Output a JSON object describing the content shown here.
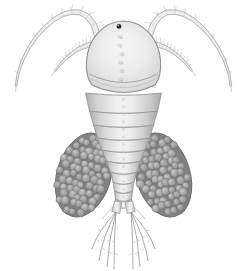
{
  "figure": {
    "background": "#ffffff",
    "colors": {
      "outline": "#8f8f8f",
      "segment_edge": "#999999",
      "body_light": "#f7f7f7",
      "body_shade": "#b9b9b9",
      "antenna_fill": "#eeeeee",
      "antenna_edge": "#a3a3a3",
      "hair": "#a9a9a9",
      "eye": "#2d2d2d",
      "eye_glint": "#f2f2f2",
      "egg_base": "#828282",
      "egg_edge": "#6a6a6a",
      "egg_hi": "#cbcbcb",
      "egg_mid": "#a5a5a5",
      "egg_lo": "#777777",
      "seta": "#909090",
      "texture": "#c3c3c3"
    },
    "center_x": 123.5,
    "eye": {
      "cx": 119,
      "cy": 26.4,
      "r": 2.4
    },
    "cephalothorax": {
      "path": "M 123.5 21 C 103 21.5 88 39 86.5 61 C 85.8 72 88 80 92 85 Q 123.5 100 155 85 C 159 80 161.2 72 160.5 61 C 159 39 144 21.5 123.5 21 Z",
      "rim_arcs": [
        "M 89.5 74 Q 123.5 91 157.5 74",
        "M 91.5 79 Q 123.5 96 155.5 79"
      ],
      "texture_ys": [
        37,
        45.5,
        54,
        62.5,
        71,
        79.5
      ]
    },
    "segments": [
      [
        93,
        111,
        38,
        34
      ],
      [
        111,
        125,
        34,
        30
      ],
      [
        125,
        138,
        30,
        26
      ],
      [
        138,
        150,
        26,
        21.5
      ],
      [
        150,
        161,
        21.5,
        17
      ],
      [
        161,
        172,
        17,
        13
      ],
      [
        172,
        182,
        13,
        10.5
      ],
      [
        182,
        191,
        10.5,
        9
      ],
      [
        191,
        199,
        9,
        8
      ],
      [
        199,
        206,
        8,
        8.6
      ]
    ],
    "antennae": [
      {
        "name": "antenna-left-outer",
        "p": [
          [
            98,
            37
          ],
          [
            85,
            -22
          ],
          [
            20,
            34
          ],
          [
            16,
            86
          ]
        ],
        "w": [
          6,
          1.6
        ],
        "side": 1
      },
      {
        "name": "antenna-left-inner",
        "p": [
          [
            94,
            44
          ],
          [
            80,
            46
          ],
          [
            68,
            54
          ],
          [
            55,
            71
          ]
        ],
        "w": [
          5,
          1.4
        ],
        "side": 1
      },
      {
        "name": "antenna-right-outer",
        "p": [
          [
            149,
            37
          ],
          [
            162,
            -22
          ],
          [
            227,
            34
          ],
          [
            231,
            86
          ]
        ],
        "w": [
          6,
          1.6
        ],
        "side": -1
      },
      {
        "name": "antenna-right-inner",
        "p": [
          [
            153,
            44
          ],
          [
            167,
            46
          ],
          [
            179,
            54
          ],
          [
            192,
            71
          ]
        ],
        "w": [
          5,
          1.4
        ],
        "side": -1
      }
    ],
    "egg_sacs": [
      {
        "name": "egg-sac-left",
        "cx": 84,
        "cy": 175,
        "rx": 27,
        "ry": 43,
        "rot": 17,
        "egg_r": 3.8,
        "seed": 7
      },
      {
        "name": "egg-sac-right",
        "cx": 163,
        "cy": 175,
        "rx": 27,
        "ry": 43,
        "rot": -17,
        "egg_r": 3.8,
        "seed": 19
      }
    ],
    "tail": {
      "rami": [
        [
          [
            114.5,
            201
          ],
          [
            121.8,
            202
          ],
          [
            119.8,
            213.5
          ],
          [
            111.8,
            211.5
          ]
        ],
        [
          [
            132.5,
            201
          ],
          [
            125.2,
            202
          ],
          [
            127.2,
            213.5
          ],
          [
            135.2,
            211.5
          ]
        ]
      ],
      "spines": [
        [
          [
            112.5,
            207
          ],
          [
            102,
            219
          ]
        ],
        [
          [
            134.5,
            207
          ],
          [
            145,
            219
          ]
        ]
      ],
      "setae": [
        {
          "origin": [
            116,
            212
          ],
          "ends": [
            [
              92,
              249
            ],
            [
              99,
              261
            ],
            [
              107,
              267
            ],
            [
              114,
              269
            ]
          ],
          "bows": [
            -5,
            -4,
            -2.5,
            -1
          ]
        },
        {
          "origin": [
            131,
            212
          ],
          "ends": [
            [
              155,
              249
            ],
            [
              148,
              261
            ],
            [
              140,
              267
            ],
            [
              133,
              269
            ]
          ],
          "bows": [
            5,
            4,
            2.5,
            1
          ]
        }
      ]
    }
  }
}
